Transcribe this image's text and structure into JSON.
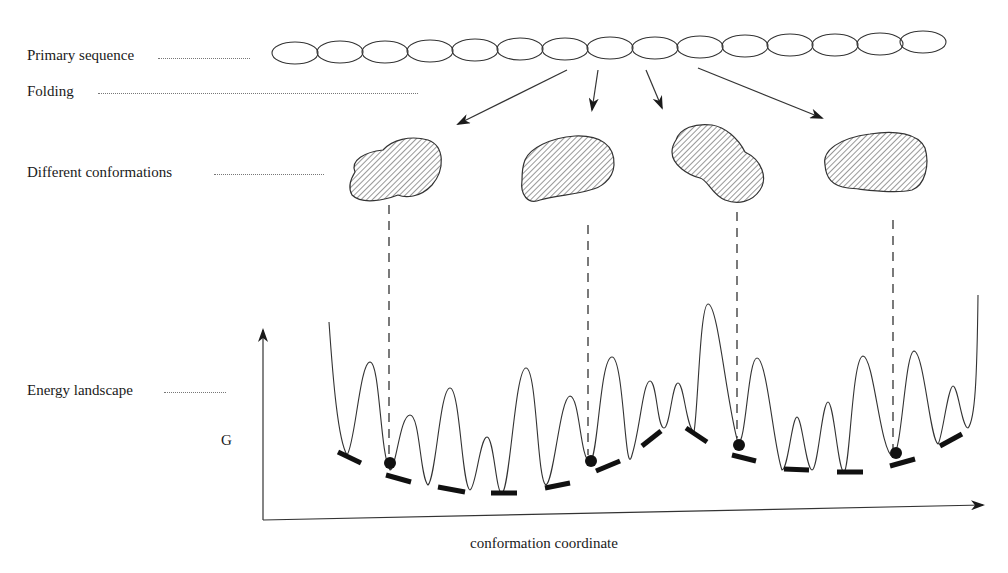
{
  "figure": {
    "stage_labels": {
      "primary_sequence": "Primary sequence",
      "folding": "Folding",
      "different_conformations": "Different conformations",
      "energy_landscape": "Energy landscape"
    },
    "axes": {
      "y_label": "G",
      "x_label": "conformation coordinate"
    },
    "primary_sequence": {
      "residue_count": 15,
      "shape": "ellipse-chain"
    },
    "folding_arrows": 4,
    "conformations": [
      {
        "id": 1,
        "shape": "hatched-blob"
      },
      {
        "id": 2,
        "shape": "hatched-blob"
      },
      {
        "id": 3,
        "shape": "hatched-blob"
      },
      {
        "id": 4,
        "shape": "hatched-blob"
      }
    ],
    "energy_landscape": {
      "local_minima_markers": "bar",
      "occupied_minima": 4,
      "ball_icon": "filled-circle"
    },
    "colors": {
      "ink": "#1a1a1a",
      "leader_dots": "#777777",
      "background": "#ffffff"
    }
  }
}
